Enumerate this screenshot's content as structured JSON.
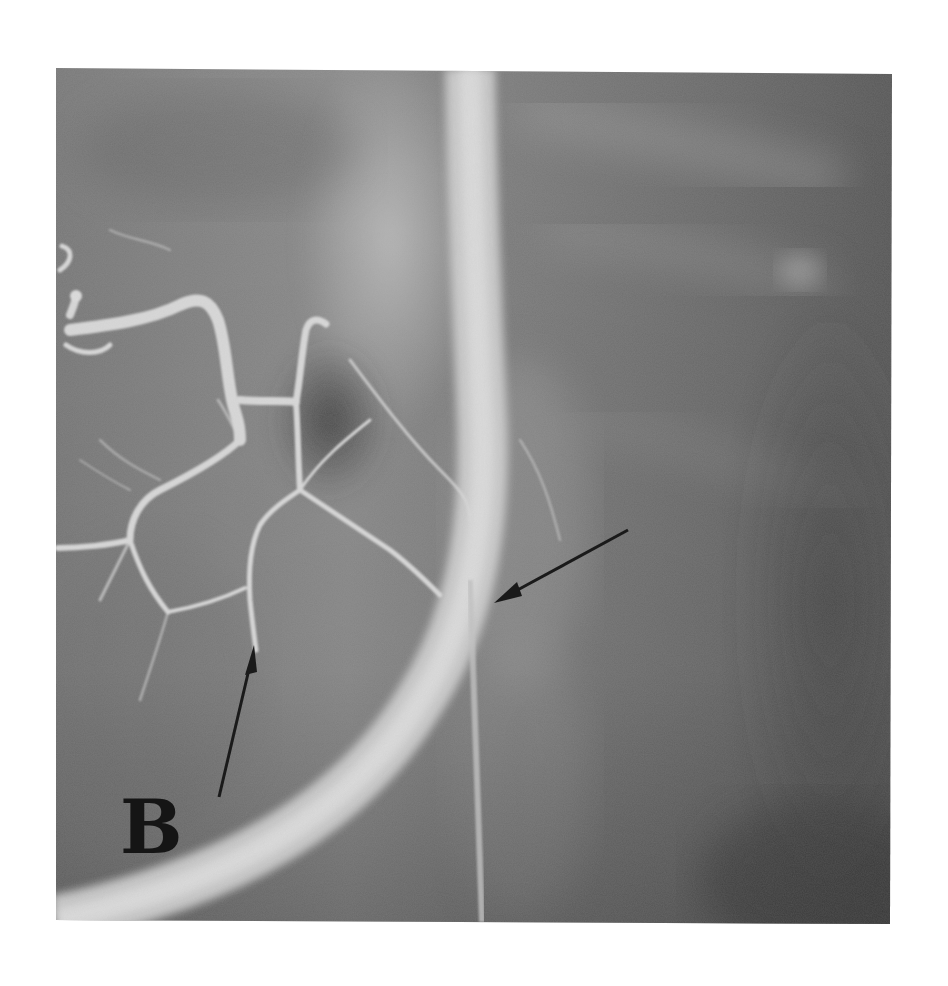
{
  "figure": {
    "panel_label": "B",
    "image_type": "angiogram",
    "image_bounds": {
      "left": 56,
      "top": 68,
      "right": 892,
      "bottom": 922
    },
    "colors": {
      "page_background": "#ffffff",
      "image_dark": "#4a4a4a",
      "image_mid": "#7e7e7e",
      "image_light": "#b8b8b8",
      "vessel": "#dcdcdc",
      "arrow": "#1a1a1a",
      "label": "#151515"
    },
    "annotations": [
      {
        "name": "arrow-lower-left",
        "from": [
          219,
          797
        ],
        "to": [
          254,
          647
        ],
        "direction": "up"
      },
      {
        "name": "arrow-right",
        "from": [
          628,
          530
        ],
        "to": [
          494,
          603
        ],
        "direction": "down-left"
      }
    ]
  }
}
